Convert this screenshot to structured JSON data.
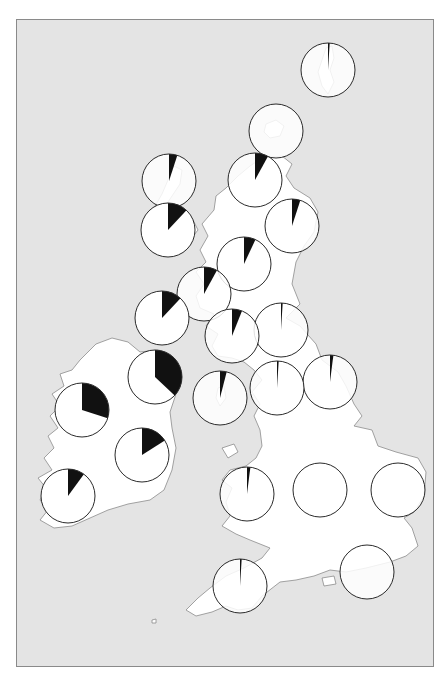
{
  "figure": {
    "description": "Map of the British Isles with pie charts by region",
    "colors": {
      "sea": "#e4e4e4",
      "land": "#ffffff",
      "coastline": "#8c8c8c",
      "pie_outline": "#2a2a2a",
      "pie_slice": "#111111",
      "frame_border": "#8a8a8a"
    },
    "pie_radius": 27
  },
  "chart_data": {
    "type": "pie-map",
    "title": "",
    "legend": [],
    "series_meaning": "black sector = proportion (unlabeled); white = remainder",
    "pies": [
      {
        "region": "Shetland",
        "cx": 328,
        "cy": 70,
        "fraction": 0.01
      },
      {
        "region": "Orkney",
        "cx": 276,
        "cy": 131,
        "fraction": 0.005
      },
      {
        "region": "Outer Hebrides (Lewis)",
        "cx": 169,
        "cy": 181,
        "fraction": 0.05
      },
      {
        "region": "Caithness/Sutherland",
        "cx": 255,
        "cy": 180,
        "fraction": 0.08
      },
      {
        "region": "Skye/Inner Hebrides",
        "cx": 168,
        "cy": 230,
        "fraction": 0.12
      },
      {
        "region": "Aberdeenshire/NE",
        "cx": 292,
        "cy": 226,
        "fraction": 0.05
      },
      {
        "region": "Inverness/Central Highlands",
        "cx": 244,
        "cy": 264,
        "fraction": 0.07
      },
      {
        "region": "Argyll",
        "cx": 204,
        "cy": 294,
        "fraction": 0.08
      },
      {
        "region": "Islay/Kintyre",
        "cx": 162,
        "cy": 318,
        "fraction": 0.12
      },
      {
        "region": "Edinburgh/Borders",
        "cx": 281,
        "cy": 330,
        "fraction": 0.01
      },
      {
        "region": "Glasgow/Ayrshire",
        "cx": 232,
        "cy": 336,
        "fraction": 0.06
      },
      {
        "region": "Northern Ireland",
        "cx": 155,
        "cy": 377,
        "fraction": 0.37
      },
      {
        "region": "Northumberland/Durham",
        "cx": 330,
        "cy": 382,
        "fraction": 0.02
      },
      {
        "region": "Cumbria",
        "cx": 277,
        "cy": 388,
        "fraction": 0.01
      },
      {
        "region": "Isle of Man",
        "cx": 220,
        "cy": 398,
        "fraction": 0.04
      },
      {
        "region": "Connacht (W Ireland)",
        "cx": 82,
        "cy": 410,
        "fraction": 0.3
      },
      {
        "region": "Leinster (E Ireland)",
        "cx": 142,
        "cy": 455,
        "fraction": 0.16
      },
      {
        "region": "Wales",
        "cx": 247,
        "cy": 494,
        "fraction": 0.02
      },
      {
        "region": "Midlands",
        "cx": 320,
        "cy": 490,
        "fraction": 0.003
      },
      {
        "region": "East Anglia",
        "cx": 398,
        "cy": 490,
        "fraction": 0.003
      },
      {
        "region": "Munster (SW Ireland)",
        "cx": 68,
        "cy": 496,
        "fraction": 0.1
      },
      {
        "region": "Devon/Cornwall",
        "cx": 240,
        "cy": 586,
        "fraction": 0.01
      },
      {
        "region": "Sussex/SE England",
        "cx": 367,
        "cy": 572,
        "fraction": 0.003
      }
    ]
  }
}
